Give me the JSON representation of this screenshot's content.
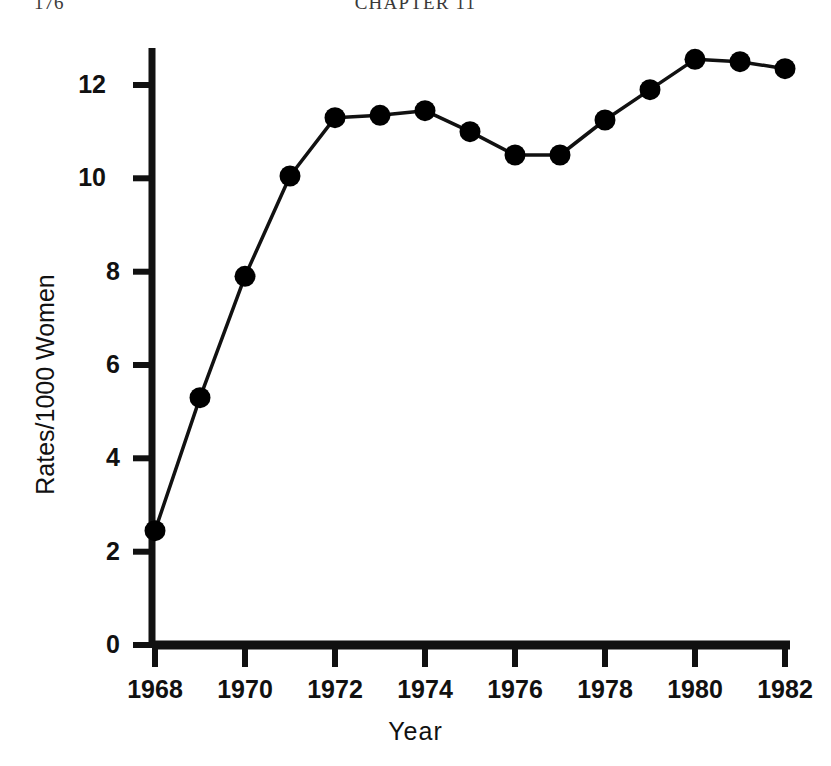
{
  "page": {
    "number": "176",
    "chapter_header": "CHAPTER 11"
  },
  "chart_data": {
    "type": "line",
    "title": "",
    "subtitle": "",
    "xlabel": "Year",
    "ylabel": "Rates/1000 Women",
    "x": [
      1968,
      1969,
      1970,
      1971,
      1972,
      1973,
      1974,
      1975,
      1976,
      1977,
      1978,
      1979,
      1980,
      1981,
      1982
    ],
    "values": [
      2.45,
      5.3,
      7.9,
      10.05,
      11.3,
      11.35,
      11.45,
      11.0,
      10.5,
      10.5,
      11.25,
      11.9,
      12.55,
      12.5,
      12.35
    ],
    "series": [
      {
        "name": "Rates/1000 Women",
        "values": [
          2.45,
          5.3,
          7.9,
          10.05,
          11.3,
          11.35,
          11.45,
          11.0,
          10.5,
          10.5,
          11.25,
          11.9,
          12.55,
          12.5,
          12.35
        ]
      }
    ],
    "xlim": [
      1968,
      1982
    ],
    "ylim": [
      0,
      13.4
    ],
    "x_tick_labels": [
      "1968",
      "1970",
      "1972",
      "1974",
      "1976",
      "1978",
      "1980",
      "1982"
    ],
    "x_tick_values": [
      1968,
      1970,
      1972,
      1974,
      1976,
      1978,
      1980,
      1982
    ],
    "y_tick_labels": [
      "0",
      "2",
      "4",
      "6",
      "8",
      "10",
      "12"
    ],
    "y_tick_values": [
      0,
      2,
      4,
      6,
      8,
      10,
      12
    ],
    "grid": false,
    "legend": false,
    "legend_position": "none",
    "marker": "filled-circle",
    "line_color": "#000000",
    "marker_color": "#000000",
    "background_color": "#ffffff"
  }
}
